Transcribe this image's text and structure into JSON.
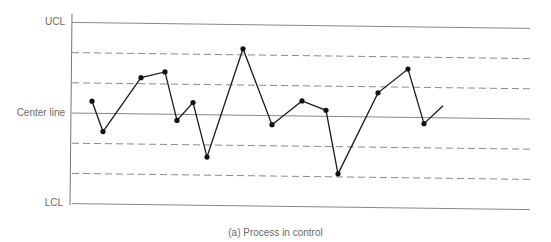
{
  "chart_data": {
    "type": "line",
    "title": "",
    "caption": "(a) Process in control",
    "xlabel": "",
    "ylabel": "",
    "y_labels": [
      "UCL",
      "Center line",
      "LCL"
    ],
    "reference_lines": [
      {
        "name": "UCL",
        "style": "solid",
        "level": 3
      },
      {
        "name": "+2 sigma",
        "style": "dashed",
        "level": 2
      },
      {
        "name": "+1 sigma",
        "style": "dashed",
        "level": 1
      },
      {
        "name": "Center line",
        "style": "solid",
        "level": 0
      },
      {
        "name": "-1 sigma",
        "style": "dashed",
        "level": -1
      },
      {
        "name": "-2 sigma",
        "style": "dashed",
        "level": -2
      },
      {
        "name": "LCL",
        "style": "solid",
        "level": -3
      }
    ],
    "ylim": [
      -3,
      3
    ],
    "series": [
      {
        "name": "Process",
        "x": [
          1,
          2,
          3,
          4,
          5,
          6,
          7,
          8,
          9,
          10,
          11,
          12,
          13,
          14,
          15
        ],
        "values": [
          0.4,
          -0.6,
          1.2,
          1.4,
          -0.2,
          0.4,
          -1.4,
          2.2,
          -0.3,
          0.5,
          0.2,
          -1.9,
          0.8,
          1.6,
          -0.2
        ]
      }
    ],
    "grid": false,
    "legend": null
  },
  "labels": {
    "ucl": "UCL",
    "center": "Center line",
    "lcl": "LCL",
    "caption": "(a) Process in control"
  }
}
